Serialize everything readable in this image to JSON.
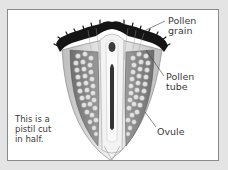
{
  "diagram": {
    "subject": "Pistil cut in half",
    "labels": [
      {
        "id": "pollen-grain",
        "text": "Pollen\ngrain"
      },
      {
        "id": "pollen-tube",
        "text": "Pollen\ntube"
      },
      {
        "id": "ovule",
        "text": "Ovule"
      }
    ],
    "caption": "This is a\npistil cut\nin half.",
    "colors": {
      "background": "#e4e4e4",
      "panel": "#ffffff",
      "border": "#8a8a8a",
      "stigma": "#1a1a1a",
      "ovary_wall": "#7d7d7d",
      "ovule": "#d9d9d9",
      "style_tissue": "#eeeeee",
      "text": "#3a3a3a"
    }
  }
}
